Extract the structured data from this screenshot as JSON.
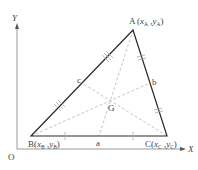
{
  "diagram": {
    "axes": {
      "x_label": "X",
      "y_label": "Y",
      "origin_label": "O",
      "axis_color": "#9a9a9a"
    },
    "vertices": {
      "A": {
        "name": "A",
        "coord_x": "x",
        "coord_y": "y",
        "sub": "A",
        "px": 133,
        "py": 30
      },
      "B": {
        "name": "B",
        "coord_x": "x",
        "coord_y": "y",
        "sub": "B",
        "px": 31,
        "py": 136
      },
      "C": {
        "name": "C",
        "coord_x": "x",
        "coord_y": "y",
        "sub": "C",
        "px": 167,
        "py": 136
      }
    },
    "midpoints": {
      "a": {
        "label": "a",
        "on_side": "BC"
      },
      "b": {
        "label": "b",
        "on_side": "CA"
      },
      "c": {
        "label": "c",
        "on_side": "AB"
      }
    },
    "centroid": {
      "label": "G"
    },
    "colors": {
      "triangle_edge": "#2a2a2a",
      "median": "#b8b8b8",
      "tick": "#a8a8a8",
      "text": "#444444"
    },
    "labels": {
      "A_text": "A",
      "B_text": "B",
      "C_text": "C",
      "open_paren": "(",
      "comma": " ,",
      "close_paren": ")"
    }
  }
}
